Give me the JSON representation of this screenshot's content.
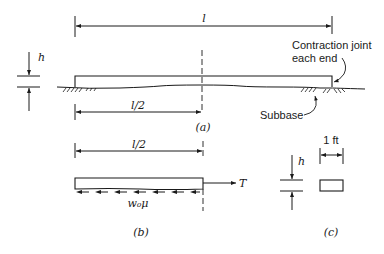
{
  "figure": {
    "part_a": {
      "caption": "(a)",
      "length_label": "l",
      "half_length_label": "l/2",
      "thickness_label": "h",
      "joint_note_line1": "Contraction joint",
      "joint_note_line2": "each end",
      "subbase_label": "Subbase"
    },
    "part_b": {
      "caption": "(b)",
      "half_length_label": "l/2",
      "force_label": "T",
      "friction_label": "w₀μ"
    },
    "part_c": {
      "caption": "(c)",
      "thickness_label": "h",
      "width_label": "1 ft"
    }
  }
}
